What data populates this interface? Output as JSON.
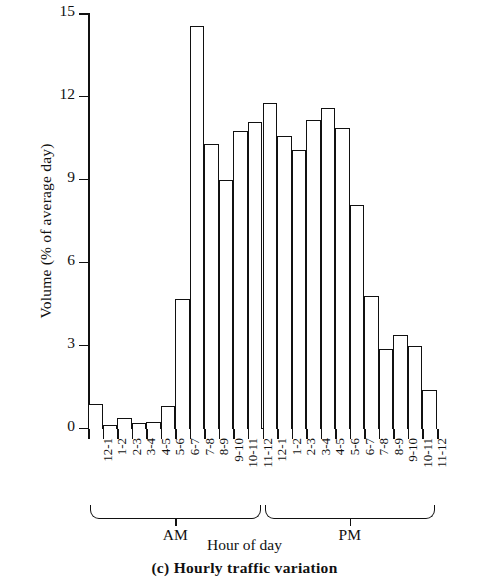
{
  "chart_data": {
    "type": "bar",
    "title": "(c) Hourly traffic variation",
    "xlabel": "Hour of day",
    "ylabel": "Volume (% of average day)",
    "ylim": [
      0,
      15
    ],
    "yticks": [
      0,
      3,
      6,
      9,
      12,
      15
    ],
    "grid": false,
    "legend": null,
    "categories": [
      "12-1",
      "1-2",
      "2-3",
      "3-4",
      "4-5",
      "5-6",
      "6-7",
      "7-8",
      "8-9",
      "9-10",
      "10-11",
      "11-12",
      "12-1",
      "1-2",
      "2-3",
      "3-4",
      "4-5",
      "5-6",
      "6-7",
      "7-8",
      "8-9",
      "9-10",
      "10-11",
      "11-12"
    ],
    "values": [
      0.9,
      0.15,
      0.4,
      0.2,
      0.25,
      0.85,
      4.7,
      14.6,
      10.3,
      9.0,
      10.8,
      11.1,
      11.8,
      10.6,
      10.1,
      11.2,
      11.6,
      10.9,
      8.1,
      4.8,
      2.9,
      3.4,
      3.0,
      1.4
    ],
    "groups": [
      {
        "label": "AM",
        "start_index": 0,
        "end_index": 11
      },
      {
        "label": "PM",
        "start_index": 12,
        "end_index": 23
      }
    ]
  }
}
